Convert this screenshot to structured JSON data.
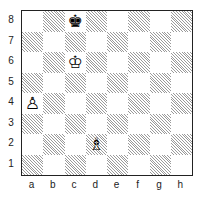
{
  "diagram": {
    "type": "chess-position",
    "files": [
      "a",
      "b",
      "c",
      "d",
      "e",
      "f",
      "g",
      "h"
    ],
    "ranks": [
      "8",
      "7",
      "6",
      "5",
      "4",
      "3",
      "2",
      "1"
    ],
    "pieces": [
      {
        "square": "c8",
        "piece": "black-king",
        "glyph": "♚"
      },
      {
        "square": "c6",
        "piece": "white-king",
        "glyph": "♔"
      },
      {
        "square": "a4",
        "piece": "white-pawn",
        "glyph": "♙"
      },
      {
        "square": "d2",
        "piece": "white-bishop",
        "glyph": "♗"
      }
    ],
    "colors": {
      "light_square": "#ffffff",
      "dark_square_hatch": "#9a9a9a",
      "border": "#222222"
    }
  }
}
